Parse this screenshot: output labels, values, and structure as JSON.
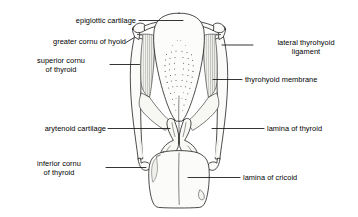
{
  "figure": {
    "background_color": "#ffffff",
    "line_color": "#000000",
    "fill_color": "#fbfbf9",
    "shade_color": "#e8e8e4",
    "width": 358,
    "height": 217
  },
  "labels": {
    "epiglottic_cartilage": "epiglottic cartilage",
    "greater_cornu_of_hyoid": "greater cornu of hyoid",
    "superior_cornu_of_thyroid": "superior cornu\nof thyroid",
    "arytenoid_cartilage": "arytenoid cartilage",
    "inferior_cornu_of_thyroid": "inferior cornu\nof thyroid",
    "lateral_thyrohyoid_ligament": "lateral thyrohyoid\nligament",
    "thyrohyoid_membrane": "thyrohyoid membrane",
    "lamina_of_thyroid": "lamina of thyroid",
    "lamina_of_cricoid": "lamina of cricoid"
  },
  "structures": [
    "epiglottic cartilage",
    "greater cornu of hyoid",
    "superior cornu of thyroid",
    "arytenoid cartilage",
    "inferior cornu of thyroid",
    "lateral thyrohyoid ligament",
    "thyrohyoid membrane",
    "lamina of thyroid",
    "lamina of cricoid"
  ]
}
